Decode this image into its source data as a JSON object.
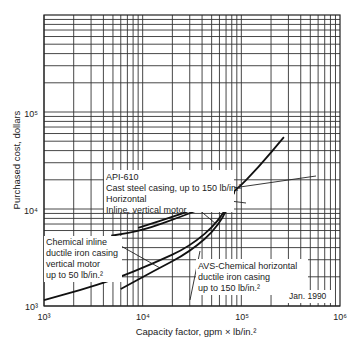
{
  "chart_data": {
    "type": "line",
    "title": "",
    "xlabel": "Capacity factor, gpm × lb/in.²",
    "ylabel": "Purchased cost, dollars",
    "xscale": "log",
    "yscale": "log",
    "xlim": [
      1000,
      1000000
    ],
    "ylim": [
      1000,
      1000000
    ],
    "x_ticks": [
      "10³",
      "10⁴",
      "10⁵",
      "10⁶"
    ],
    "y_ticks": [
      "10³",
      "10⁴",
      "10⁵"
    ],
    "grid": true,
    "annotation": "Jan. 1990",
    "series": [
      {
        "name": "API-610 Cast steel casing, up to 150 lb/in.² (Horizontal)",
        "x": [
          4800,
          10000,
          25000,
          60000,
          85000,
          150000,
          270000
        ],
        "y": [
          5300,
          6000,
          8400,
          11900,
          15000,
          27000,
          55000
        ]
      },
      {
        "name": "Inline, vertical motor",
        "x": [
          9000,
          25000,
          60000,
          85000
        ],
        "y": [
          6400,
          8900,
          12600,
          15000
        ]
      },
      {
        "name": "Chemical inline ductile iron casing vertical motor up to 50 lb/in.²",
        "x": [
          1000,
          2300,
          5100,
          13000,
          30000,
          60000,
          85000
        ],
        "y": [
          1150,
          1450,
          1880,
          2760,
          4100,
          7500,
          15000
        ]
      },
      {
        "name": "AVS-Chemical horizontal ductile iron casing up to 150 lb/in.²",
        "x": [
          6000,
          13000,
          30000,
          60000,
          85000
        ],
        "y": [
          1500,
          2300,
          3600,
          6700,
          15000
        ]
      }
    ]
  },
  "labels": {
    "api610_line1": "API-610",
    "api610_line2": "Cast steel casing, up to 150 lb/in.²",
    "horizontal": "Horizontal",
    "inline_vertical": "Inline, vertical motor",
    "chem_inline_1": "Chemical inline",
    "chem_inline_2": "ductile iron casing",
    "chem_inline_3": "vertical motor",
    "chem_inline_4": "up to 50 lb/in.²",
    "avs_1": "AVS-Chemical horizontal",
    "avs_2": "ductile iron casing",
    "avs_3": "up to 150 lb/in.²",
    "date": "Jan. 1990",
    "xlabel": "Capacity factor, gpm × lb/in.²",
    "ylabel": "Purchased cost, dollars",
    "x_ticks": [
      "10³",
      "10⁴",
      "10⁵",
      "10⁶"
    ],
    "y_ticks": [
      "10³",
      "10⁴",
      "10⁵"
    ]
  }
}
